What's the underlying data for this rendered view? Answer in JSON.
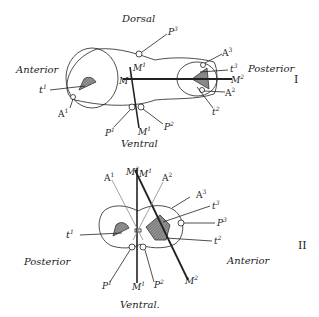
{
  "figure_I": {
    "numeral": "I",
    "orientation": {
      "top": "Dorsal",
      "bottom": "Ventral",
      "left": "Anterior",
      "right": "Posterior"
    },
    "labels": {
      "t1": "t",
      "t1_sup": "1",
      "A1": "A",
      "A1_sup": "1",
      "P1": "P",
      "P1_sup": "1",
      "M1_top": "M",
      "M1_top_sup": "1",
      "M1_bot": "M",
      "M1_bot_sup": "1",
      "M2_left": "M",
      "M2_left_sup": "2",
      "M2_right": "M",
      "M2_right_sup": "2",
      "P2": "P",
      "P2_sup": "2",
      "P3": "P",
      "P3_sup": "3",
      "A3": "A",
      "A3_sup": "3",
      "t3": "t",
      "t3_sup": "3",
      "A2": "A",
      "A2_sup": "2",
      "t2": "t",
      "t2_sup": "2"
    }
  },
  "figure_II": {
    "numeral": "II",
    "orientation": {
      "left": "Posterior",
      "right": "Anterior",
      "bottom": "Ventral."
    },
    "labels": {
      "M2_top": "M",
      "M2_top_sup": "2",
      "M1_top": "M",
      "M1_top_sup": "1",
      "A1": "A",
      "A1_sup": "1",
      "A2": "A",
      "A2_sup": "2",
      "A3": "A",
      "A3_sup": "3",
      "t3": "t",
      "t3_sup": "3",
      "P3": "P",
      "P3_sup": "3",
      "t2": "t",
      "t2_sup": "2",
      "t1": "t",
      "t1_sup": "1",
      "P1": "P",
      "P1_sup": "1",
      "M1_bot": "M",
      "M1_bot_sup": "1",
      "P2": "P",
      "P2_sup": "2",
      "M2_bot": "M",
      "M2_bot_sup": "2"
    }
  },
  "colors": {
    "ink": "#222222",
    "hatch": "#888888",
    "background": "#ffffff"
  }
}
